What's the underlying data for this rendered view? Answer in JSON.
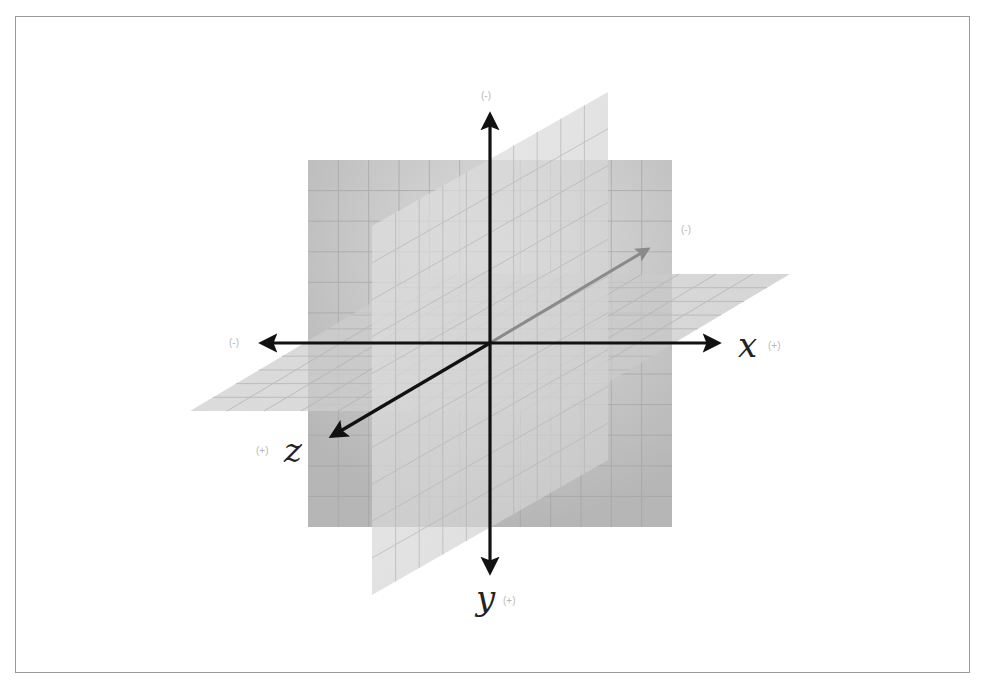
{
  "diagram": {
    "origin": [
      490,
      343
    ],
    "colors": {
      "frame": "#9a9a9a",
      "plane_front": "#b9b9b9",
      "plane_front_light": "#d4d4d4",
      "plane_slanted": "#cfcfcf",
      "plane_horizontal": "#c6c6c6",
      "grid": "#a8a8a8",
      "axis": "#111111",
      "axis_hidden": "#8a8a8a",
      "sign_label": "#b8b8b8",
      "axis_label": "#222222"
    },
    "planes": {
      "front_xy": {
        "points": "308,160 672,160 672,527 308,527",
        "grid": 12
      },
      "slanted_yz": {
        "points": "372,226 608,92 608,460 372,595",
        "grid": 10
      },
      "horizontal_xz": {
        "points": "420,274 790,274 560,411 190,411",
        "grid": 10
      }
    },
    "axes": {
      "x_pos": {
        "from": [
          490,
          343
        ],
        "to": [
          718,
          343
        ],
        "label": "x",
        "sign": "(+)"
      },
      "x_neg": {
        "from": [
          490,
          343
        ],
        "to": [
          262,
          343
        ],
        "sign": "(-)"
      },
      "y_neg_up": {
        "from": [
          490,
          343
        ],
        "to": [
          490,
          115
        ],
        "sign": "(-)"
      },
      "y_pos_down": {
        "from": [
          490,
          343
        ],
        "to": [
          490,
          572
        ],
        "label": "y",
        "sign": "(+)"
      },
      "z_pos": {
        "from": [
          490,
          343
        ],
        "to": [
          332,
          436
        ],
        "label": "z",
        "sign": "(+)"
      },
      "z_neg": {
        "from": [
          490,
          343
        ],
        "to": [
          648,
          249
        ],
        "sign": "(-)"
      }
    },
    "labels": {
      "x_letter": "x",
      "x_sign": "(+)",
      "x_neg_sign": "(-)",
      "y_letter": "y",
      "y_sign": "(+)",
      "y_top_sign": "(-)",
      "z_letter": "z",
      "z_sign": "(+)",
      "z_neg_sign": "(-)"
    }
  }
}
